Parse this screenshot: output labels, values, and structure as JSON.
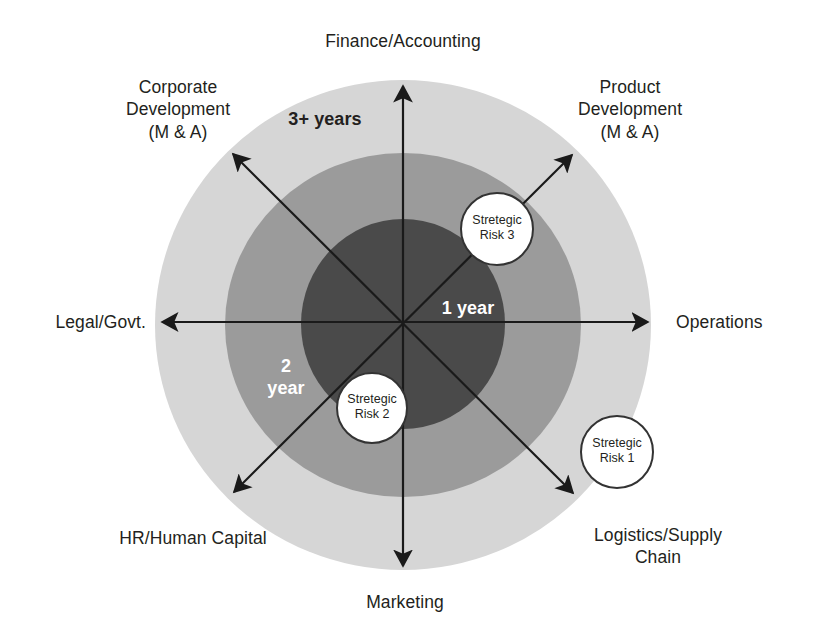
{
  "diagram": {
    "title_visible": false,
    "center": {
      "x": 403,
      "y": 322
    },
    "colors": {
      "outer_ring": "#d6d6d6",
      "middle_ring": "#9b9b9b",
      "inner_core": "#4a4a4a",
      "axis": "#1a1a1a",
      "text": "#231f20",
      "light_text": "#ffffff",
      "bubble_fill": "#ffffff",
      "bubble_stroke": "#333333",
      "background": "#ffffff"
    },
    "axes": [
      {
        "id": "finance-accounting",
        "label": "Finance/Accounting",
        "direction": "up",
        "double_headed": false
      },
      {
        "id": "product-development",
        "label": "Product\nDevelopment\n(M & A)",
        "direction": "up-right",
        "double_headed": false
      },
      {
        "id": "operations",
        "label": "Operations",
        "direction": "right",
        "double_headed": true
      },
      {
        "id": "logistics-supply-chain",
        "label": "Logistics/Supply\nChain",
        "direction": "down-right",
        "double_headed": true
      },
      {
        "id": "marketing",
        "label": "Marketing",
        "direction": "down",
        "double_headed": true
      },
      {
        "id": "hr-human-capital",
        "label": "HR/Human Capital",
        "direction": "down-left",
        "double_headed": true
      },
      {
        "id": "legal-govt",
        "label": "Legal/Govt.",
        "direction": "left",
        "double_headed": true
      },
      {
        "id": "corporate-development",
        "label": "Corporate\nDevelopment\n(M & A)",
        "direction": "up-left",
        "double_headed": true
      }
    ],
    "rings": [
      {
        "id": "outer",
        "label": "3+ years",
        "fill": "#d6d6d6",
        "text_color": "#231f20"
      },
      {
        "id": "middle",
        "label": "2\nyear",
        "fill": "#9b9b9b",
        "text_color": "#ffffff"
      },
      {
        "id": "inner",
        "label": "1 year",
        "fill": "#4a4a4a",
        "text_color": "#ffffff"
      }
    ],
    "risk_bubbles": [
      {
        "id": "strategic-risk-1",
        "label": "Stretegic\nRisk 1",
        "x": 617,
        "y": 452,
        "r": 36
      },
      {
        "id": "strategic-risk-2",
        "label": "Stretegic\nRisk 2",
        "x": 372,
        "y": 408,
        "r": 35
      },
      {
        "id": "strategic-risk-3",
        "label": "Stretegic\nRisk 3",
        "x": 497,
        "y": 229,
        "r": 36
      }
    ]
  }
}
